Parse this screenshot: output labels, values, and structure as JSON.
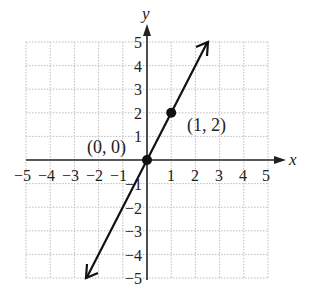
{
  "graph": {
    "x_axis_label": "x",
    "y_axis_label": "y",
    "x_ticks": [
      "−5",
      "−4",
      "−3",
      "−2",
      "−1",
      "1",
      "2",
      "3",
      "4",
      "5"
    ],
    "y_ticks_pos": [
      "5",
      "4",
      "3",
      "2",
      "1"
    ],
    "y_ticks_neg": [
      "−1",
      "−2",
      "−3",
      "−4",
      "−5"
    ],
    "points": [
      {
        "label": "(0, 0)",
        "x": 0,
        "y": 0
      },
      {
        "label": "(1, 2)",
        "x": 1,
        "y": 2
      }
    ],
    "line": {
      "equation": "y = 2x",
      "from": [
        -2.5,
        -5
      ],
      "to": [
        2.5,
        5
      ]
    },
    "range": {
      "x": [
        -5,
        5
      ],
      "y": [
        -5,
        5
      ]
    },
    "grid": true
  }
}
